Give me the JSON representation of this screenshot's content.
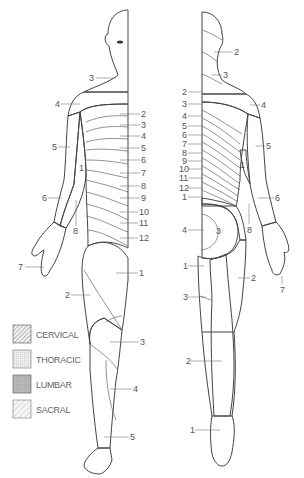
{
  "figure": {
    "views": [
      "anterior",
      "posterior"
    ]
  },
  "legend": {
    "items": [
      {
        "label": "CERVICAL",
        "pattern": "cervical-hatch",
        "color": "#8a8a8a"
      },
      {
        "label": "THORACIC",
        "pattern": "thoracic-dots",
        "color": "#e6e6e6"
      },
      {
        "label": "LUMBAR",
        "pattern": "lumbar-fill",
        "color": "#b5b5b5"
      },
      {
        "label": "SACRAL",
        "pattern": "sacral-hatch",
        "color": "#c8c8c8"
      }
    ]
  },
  "front": {
    "labels": [
      {
        "text": "3",
        "x": 91,
        "y": 81
      },
      {
        "text": "4",
        "x": 56,
        "y": 107
      },
      {
        "text": "2",
        "x": 141,
        "y": 117
      },
      {
        "text": "3",
        "x": 141,
        "y": 128
      },
      {
        "text": "4",
        "x": 141,
        "y": 139
      },
      {
        "text": "5",
        "x": 141,
        "y": 151
      },
      {
        "text": "5",
        "x": 53,
        "y": 150
      },
      {
        "text": "1",
        "x": 79,
        "y": 171
      },
      {
        "text": "6",
        "x": 141,
        "y": 163
      },
      {
        "text": "7",
        "x": 141,
        "y": 176
      },
      {
        "text": "8",
        "x": 141,
        "y": 189
      },
      {
        "text": "9",
        "x": 141,
        "y": 201
      },
      {
        "text": "10",
        "x": 139,
        "y": 215
      },
      {
        "text": "11",
        "x": 139,
        "y": 226
      },
      {
        "text": "12",
        "x": 139,
        "y": 241
      },
      {
        "text": "6",
        "x": 43,
        "y": 201
      },
      {
        "text": "8",
        "x": 74,
        "y": 234
      },
      {
        "text": "7",
        "x": 19,
        "y": 270
      },
      {
        "text": "1",
        "x": 139,
        "y": 276
      },
      {
        "text": "2",
        "x": 66,
        "y": 298
      },
      {
        "text": "3",
        "x": 140,
        "y": 345
      },
      {
        "text": "4",
        "x": 133,
        "y": 392
      },
      {
        "text": "5",
        "x": 130,
        "y": 440
      }
    ]
  },
  "back": {
    "labels": [
      {
        "text": "2",
        "x": 234,
        "y": 55
      },
      {
        "text": "3",
        "x": 223,
        "y": 78
      },
      {
        "text": "2",
        "x": 182,
        "y": 95
      },
      {
        "text": "3",
        "x": 182,
        "y": 107
      },
      {
        "text": "4",
        "x": 261,
        "y": 108
      },
      {
        "text": "4",
        "x": 182,
        "y": 119
      },
      {
        "text": "5",
        "x": 182,
        "y": 129
      },
      {
        "text": "6",
        "x": 182,
        "y": 138
      },
      {
        "text": "7",
        "x": 182,
        "y": 147
      },
      {
        "text": "5",
        "x": 266,
        "y": 149
      },
      {
        "text": "8",
        "x": 182,
        "y": 156
      },
      {
        "text": "9",
        "x": 182,
        "y": 164
      },
      {
        "text": "10",
        "x": 180,
        "y": 172
      },
      {
        "text": "11",
        "x": 180,
        "y": 181
      },
      {
        "text": "12",
        "x": 180,
        "y": 191
      },
      {
        "text": "1",
        "x": 182,
        "y": 200
      },
      {
        "text": "1",
        "x": 240,
        "y": 168
      },
      {
        "text": "6",
        "x": 275,
        "y": 201
      },
      {
        "text": "4",
        "x": 182,
        "y": 233
      },
      {
        "text": "3",
        "x": 216,
        "y": 234
      },
      {
        "text": "8",
        "x": 247,
        "y": 233
      },
      {
        "text": "1",
        "x": 183,
        "y": 269
      },
      {
        "text": "2",
        "x": 251,
        "y": 281
      },
      {
        "text": "7",
        "x": 281,
        "y": 293
      },
      {
        "text": "3",
        "x": 183,
        "y": 300
      },
      {
        "text": "2",
        "x": 186,
        "y": 364
      },
      {
        "text": "1",
        "x": 190,
        "y": 433
      }
    ]
  }
}
